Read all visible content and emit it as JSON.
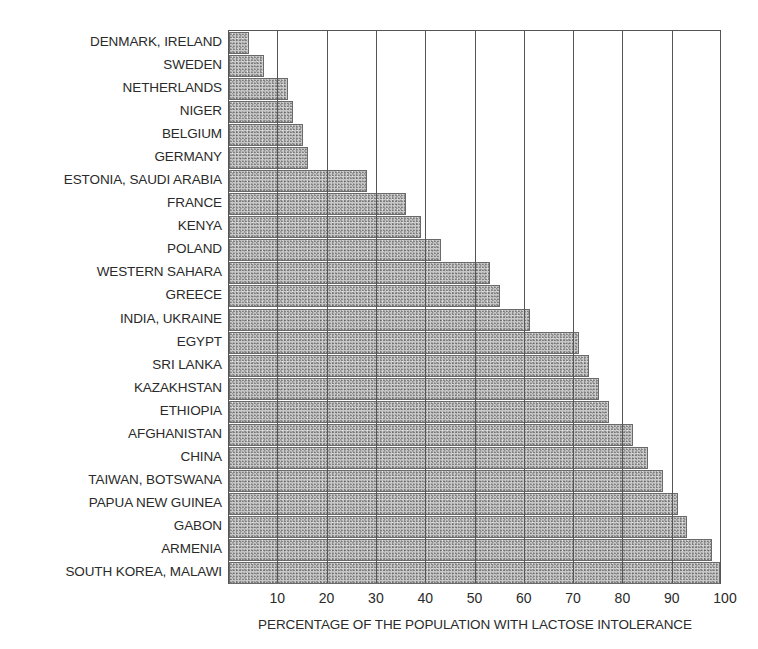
{
  "chart_data": {
    "type": "bar",
    "orientation": "horizontal",
    "title": "",
    "xlabel": "PERCENTAGE OF THE POPULATION WITH LACTOSE INTOLERANCE",
    "ylabel": "",
    "xlim": [
      0,
      100
    ],
    "xticks": [
      10,
      20,
      30,
      40,
      50,
      60,
      70,
      80,
      90,
      100
    ],
    "grid": "vertical",
    "legend": null,
    "categories": [
      "DENMARK, IRELAND",
      "SWEDEN",
      "NETHERLANDS",
      "NIGER",
      "BELGIUM",
      "GERMANY",
      "ESTONIA, SAUDI ARABIA",
      "FRANCE",
      "KENYA",
      "POLAND",
      "WESTERN SAHARA",
      "GREECE",
      "INDIA, UKRAINE",
      "EGYPT",
      "SRI LANKA",
      "KAZAKHSTAN",
      "ETHIOPIA",
      "AFGHANISTAN",
      "CHINA",
      "TAIWAN, BOTSWANA",
      "PAPUA NEW  GUINEA",
      "GABON",
      "ARMENIA",
      "SOUTH KOREA, MALAWI"
    ],
    "values": [
      4,
      7,
      12,
      13,
      15,
      16,
      28,
      36,
      39,
      43,
      53,
      55,
      61,
      71,
      73,
      75,
      77,
      82,
      85,
      88,
      91,
      93,
      98,
      100
    ]
  }
}
